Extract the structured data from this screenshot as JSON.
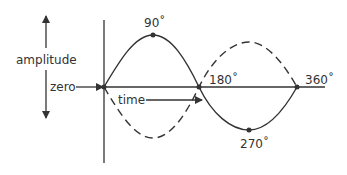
{
  "diagram": {
    "labels": {
      "amplitude": "amplitude",
      "zero": "zero",
      "time": "time",
      "deg90": "90˚",
      "deg180": "180˚",
      "deg270": "270˚",
      "deg360": "360˚"
    },
    "colors": {
      "stroke": "#333333",
      "text": "#333333",
      "background": "#ffffff"
    },
    "curves": [
      {
        "name": "solid-sine",
        "style": "solid",
        "points_deg": [
          0,
          90,
          180,
          270,
          360
        ]
      },
      {
        "name": "dashed-inverted-sine",
        "style": "dashed",
        "points_deg": [
          0,
          90,
          180,
          270,
          360
        ]
      }
    ]
  }
}
